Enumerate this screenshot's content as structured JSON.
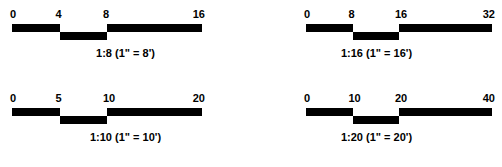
{
  "page": {
    "background_color": "#ffffff",
    "bar_color": "#000000",
    "text_color": "#000000"
  },
  "scales": [
    {
      "id": "scale-1-8",
      "position": "top-left",
      "ratio": "1:8",
      "caption": "1:8 (1\" = 8')",
      "ticks": [
        "0",
        "4",
        "8",
        "16"
      ],
      "tick_values": [
        0,
        4,
        8,
        16
      ],
      "units": "feet per inch",
      "equivalent": "1 inch = 8 feet"
    },
    {
      "id": "scale-1-16",
      "position": "top-right",
      "ratio": "1:16",
      "caption": "1:16 (1\" = 16')",
      "ticks": [
        "0",
        "8",
        "16",
        "32"
      ],
      "tick_values": [
        0,
        8,
        16,
        32
      ],
      "units": "feet per inch",
      "equivalent": "1 inch = 16 feet"
    },
    {
      "id": "scale-1-10",
      "position": "bottom-left",
      "ratio": "1:10",
      "caption": "1:10 (1\" = 10')",
      "ticks": [
        "0",
        "5",
        "10",
        "20"
      ],
      "tick_values": [
        0,
        5,
        10,
        20
      ],
      "units": "feet per inch",
      "equivalent": "1 inch = 10 feet"
    },
    {
      "id": "scale-1-20",
      "position": "bottom-right",
      "ratio": "1:20",
      "caption": "1:20 (1\" = 20')",
      "ticks": [
        "0",
        "10",
        "20",
        "40"
      ],
      "tick_values": [
        0,
        10,
        20,
        40
      ],
      "units": "feet per inch",
      "equivalent": "1 inch = 20 feet"
    }
  ]
}
